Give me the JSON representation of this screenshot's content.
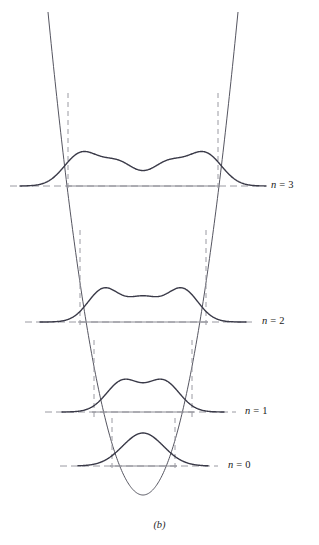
{
  "figure": {
    "caption": "(b)",
    "caption_y": 519,
    "width": 319,
    "height": 545,
    "background": "#ffffff",
    "curve_color": "#3a3a48",
    "potential_color": "#555560",
    "baseline_color": "#8a8a92",
    "dashed_color": "#9a9aa2",
    "label_color": "#1a1a1a"
  },
  "chart_data": {
    "type": "line",
    "title": "",
    "subtitle": "",
    "xlabel": "",
    "ylabel": "",
    "grid": false,
    "legend_position": "right",
    "axis_x_center": 143,
    "potential_well": {
      "name": "parabolic-potential",
      "vertex_x": 143,
      "vertex_y": 495,
      "left_top_x": 48,
      "right_top_x": 238,
      "top_y": 12,
      "curvature_note": "V(x) proportional to (x - 143)^2, reaching y=12 at x=48 and x=238"
    },
    "levels": [
      {
        "n": 3,
        "label": "n = 3",
        "label_x": 271,
        "baseline_y": 186,
        "baseline_solid_x1": 66,
        "baseline_solid_x2": 220,
        "baseline_dash_x1": 10,
        "baseline_dash_x2": 262,
        "turning_point_left_x": 68,
        "turning_point_right_x": 218,
        "dashed_vertical_top_y": 93,
        "peaks": 4,
        "peak_x": [
          81,
          118,
          168,
          205
        ],
        "peak_height": [
          32,
          23,
          23,
          32
        ],
        "curve_x_start": 20,
        "curve_x_end": 266
      },
      {
        "n": 2,
        "label": "n = 2",
        "label_x": 262,
        "baseline_y": 322,
        "baseline_solid_x1": 78,
        "baseline_solid_x2": 208,
        "baseline_dash_x1": 25,
        "baseline_dash_x2": 252,
        "turning_point_left_x": 80,
        "turning_point_right_x": 206,
        "dashed_vertical_top_y": 230,
        "peaks": 3,
        "peak_x": [
          104,
          143,
          182
        ],
        "peak_height": [
          33,
          23,
          33
        ],
        "curve_x_start": 40,
        "curve_x_end": 246
      },
      {
        "n": 1,
        "label": "n = 1",
        "label_x": 245,
        "baseline_y": 412,
        "baseline_solid_x1": 92,
        "baseline_solid_x2": 194,
        "baseline_dash_x1": 45,
        "baseline_dash_x2": 236,
        "turning_point_left_x": 94,
        "turning_point_right_x": 192,
        "dashed_vertical_top_y": 340,
        "peaks": 2,
        "peak_x": [
          123,
          163
        ],
        "peak_height": [
          31,
          31
        ],
        "curve_x_start": 62,
        "curve_x_end": 224
      },
      {
        "n": 0,
        "label": "n = 0",
        "label_x": 228,
        "baseline_y": 466,
        "baseline_solid_x1": 110,
        "baseline_solid_x2": 177,
        "baseline_dash_x1": 60,
        "baseline_dash_x2": 218,
        "turning_point_left_x": 112,
        "turning_point_right_x": 175,
        "dashed_vertical_top_y": 418,
        "peaks": 1,
        "peak_x": [
          143
        ],
        "peak_height": [
          33
        ],
        "curve_x_start": 78,
        "curve_x_end": 208
      }
    ]
  }
}
